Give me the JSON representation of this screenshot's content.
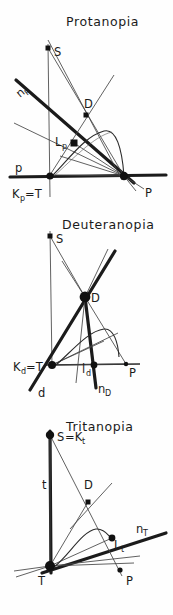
{
  "figure": {
    "kind": "color-vision-confusion-line-diagrams",
    "background_color": "#fefefe",
    "ink_color": "#1b1b1b",
    "panel_count": 3
  },
  "panels": [
    {
      "id": "protanopia",
      "title": "Protanopia",
      "labels": {
        "s_point": "S",
        "d_point": "D",
        "copunctal_line": "n",
        "copunctal_sub": "P",
        "l_point": "L",
        "l_sub": "p",
        "axis_line": "p",
        "origin": "K",
        "origin_sub": "p",
        "origin_eq": "=T",
        "p_point": "P"
      },
      "points": {
        "S": [
          48,
          48
        ],
        "D": [
          86,
          115
        ],
        "L": [
          74,
          143
        ],
        "K": [
          50,
          175
        ],
        "P": [
          124,
          176
        ]
      }
    },
    {
      "id": "deuteranopia",
      "title": "Deuteranopia",
      "labels": {
        "s_point": "S",
        "d_point": "D",
        "copunctal_line": "n",
        "copunctal_sub": "D",
        "l_point": "l",
        "l_sub": "d",
        "axis_line": "d",
        "origin": "K",
        "origin_sub": "d",
        "origin_eq": "=T",
        "p_point": "P"
      },
      "points": {
        "S": [
          50,
          236
        ],
        "D": [
          85,
          297
        ],
        "l": [
          94,
          365
        ],
        "K": [
          52,
          365
        ],
        "P": [
          126,
          364
        ]
      }
    },
    {
      "id": "tritanopia",
      "title": "Tritanopia",
      "labels": {
        "s_point": "S",
        "s_eq": "=K",
        "s_sub": "t",
        "d_point": "D",
        "copunctal_line": "n",
        "copunctal_sub": "T",
        "l_point": "L",
        "l_sub": "t",
        "axis_line": "t",
        "origin": "T",
        "p_point": "P"
      },
      "points": {
        "S": [
          50,
          435
        ],
        "D": [
          88,
          502
        ],
        "L": [
          112,
          538
        ],
        "T": [
          50,
          566
        ],
        "P": [
          120,
          570
        ]
      }
    }
  ]
}
